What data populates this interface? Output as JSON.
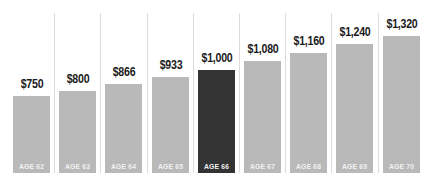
{
  "chart_data": {
    "type": "bar",
    "title": "",
    "xlabel": "",
    "ylabel": "",
    "grid": false,
    "categories": [
      "AGE 62",
      "AGE 63",
      "AGE 64",
      "AGE 65",
      "AGE 66",
      "AGE 67",
      "AGE 68",
      "AGE 69",
      "AGE 70"
    ],
    "values": [
      750,
      800,
      866,
      933,
      1000,
      1080,
      1160,
      1240,
      1320
    ],
    "value_labels": [
      "$750",
      "$800",
      "$866",
      "$933",
      "$1,000",
      "$1,080",
      "$1,160",
      "$1,240",
      "$1,320"
    ],
    "highlight_index": 4,
    "ylim": [
      0,
      1400
    ]
  },
  "colors": {
    "bar": "#b9b9b9",
    "highlight": "#333333",
    "value_text": "#1a1a1a",
    "category_text": "#f2f2f2",
    "divider": "#dcdcdc"
  }
}
